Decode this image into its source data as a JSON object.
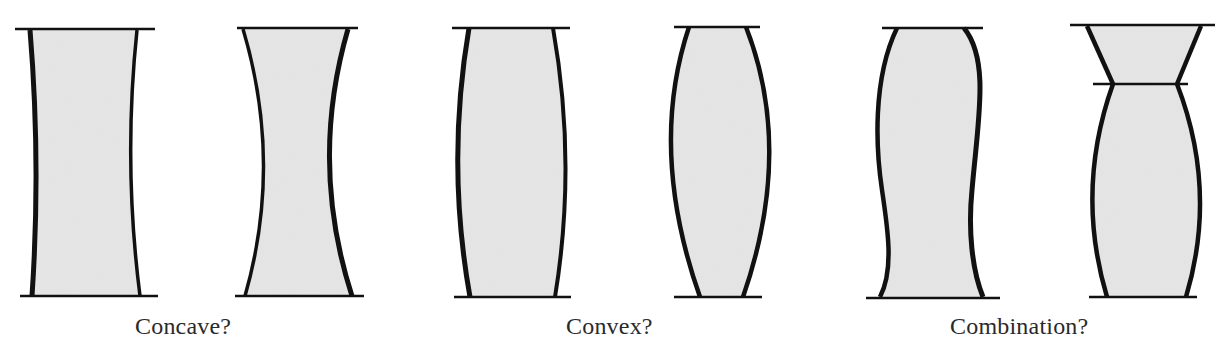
{
  "diagram": {
    "groups": [
      {
        "id": "concave",
        "caption": "Concave?",
        "caption_x": 135,
        "shapes": [
          "concave-1",
          "concave-2"
        ]
      },
      {
        "id": "convex",
        "caption": "Convex?",
        "caption_x": 566,
        "shapes": [
          "convex-1",
          "convex-2"
        ]
      },
      {
        "id": "combination",
        "caption": "Combination?",
        "caption_x": 950,
        "shapes": [
          "combination-1",
          "combination-2"
        ]
      }
    ],
    "colors": {
      "fill": "#e6e6e6",
      "stroke": "#111111",
      "background": "#ffffff"
    }
  }
}
